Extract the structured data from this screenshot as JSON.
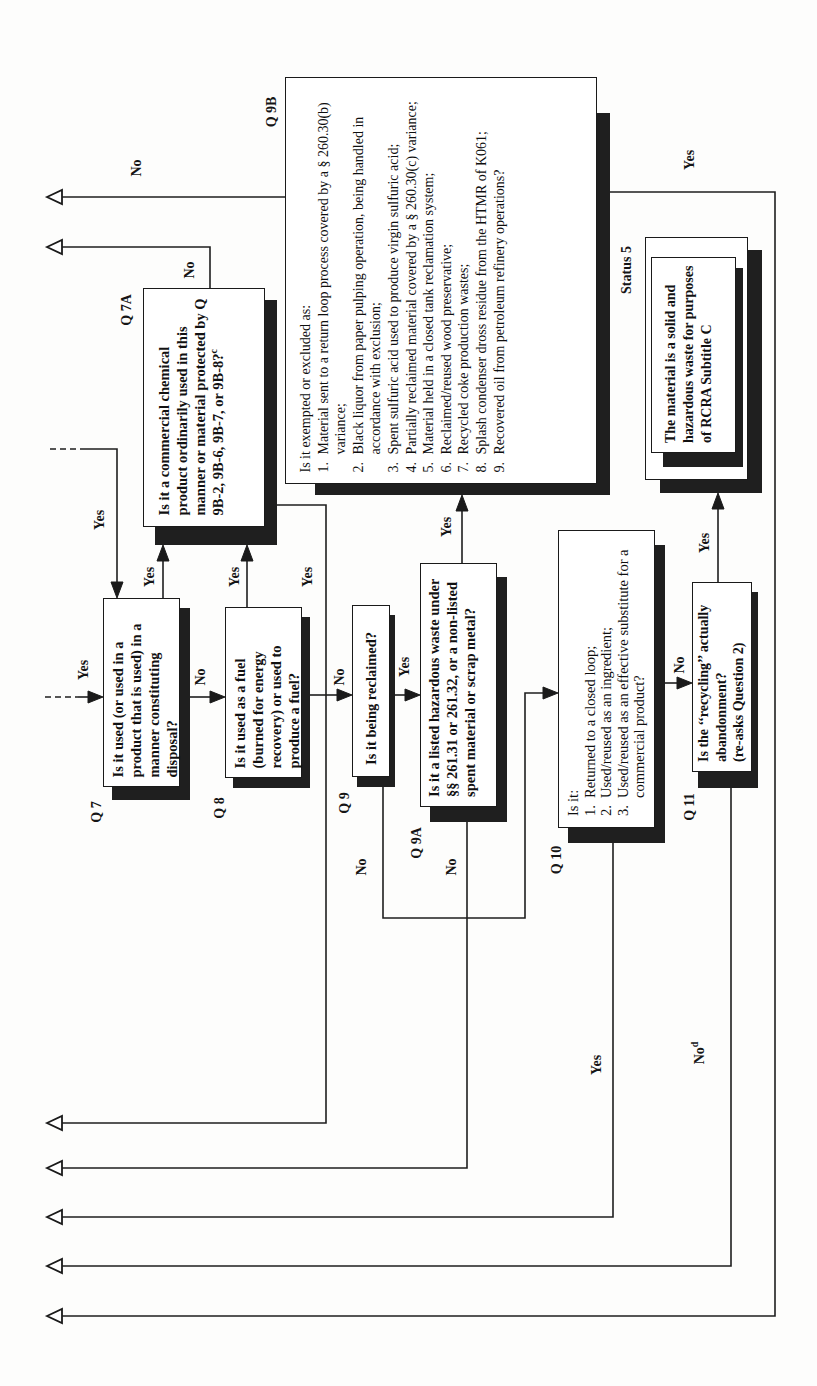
{
  "diagram": {
    "nodes": {
      "q7": {
        "id": "Q 7",
        "text": "Is it used (or used in a product that is used) in a manner constituting disposal?"
      },
      "q7a": {
        "id": "Q 7A",
        "text": "Is it a commercial chemical product ordinarily used in this manner or material protected by Q 9B-2, 9B-6, 9B-7, or 9B-8?",
        "footnote": "c"
      },
      "q8": {
        "id": "Q 8",
        "text": "Is it used as a fuel (burned for energy recovery) or used to produce a fuel?"
      },
      "q9": {
        "id": "Q 9",
        "text": "Is it being reclaimed?"
      },
      "q9a": {
        "id": "Q 9A",
        "text": "Is it a listed hazardous waste under §§ 261.31 or 261.32, or a non-listed spent material or scrap metal?"
      },
      "q9b": {
        "id": "Q 9B",
        "intro": "Is it exempted or excluded as:",
        "items": [
          {
            "num": "1.",
            "text": "Material sent to a return loop process covered by a § 260.30(b) variance;"
          },
          {
            "num": "2.",
            "text": "Black liquor from paper pulping operation, being handled in accordance with exclusion;"
          },
          {
            "num": "3.",
            "text": "Spent sulfuric acid used to produce virgin sulfuric acid;"
          },
          {
            "num": "4.",
            "text": "Partially reclaimed material covered by a § 260.30(c) variance;"
          },
          {
            "num": "5.",
            "text": "Material held in a closed tank reclamation system;"
          },
          {
            "num": "6.",
            "text": "Reclaimed/reused wood preservative;"
          },
          {
            "num": "7.",
            "text": "Recycled coke production wastes;"
          },
          {
            "num": "8.",
            "text": "Splash condenser dross residue from the HTMR of K061;"
          },
          {
            "num": "9.",
            "text": "Recovered oil from petroleum refinery operations?"
          }
        ]
      },
      "q10": {
        "id": "Q 10",
        "intro": "Is it:",
        "items": [
          {
            "num": "1.",
            "text": "Returned to a closed loop;"
          },
          {
            "num": "2.",
            "text": "Used/reused as an ingredient;"
          },
          {
            "num": "3.",
            "text": "Used/reused as an effective substitute for a commercial product?"
          }
        ]
      },
      "q11": {
        "id": "Q 11",
        "text": "Is the ‘‘recycling’’ actually abandonment?",
        "note": "(re-asks Question 2)"
      },
      "status5": {
        "label": "Status 5",
        "text": "The material is a solid and hazardous waste for purposes of RCRA Subtitle C"
      }
    },
    "edge_labels": {
      "q9b_no": "No",
      "q7a_no": "No",
      "entry_top_yes": "Yes",
      "entry_left_yes": "Yes",
      "q7_yes": "Yes",
      "q7_no": "No",
      "q8_yes": "Yes",
      "q7a_yes": "Yes",
      "q8_no": "No",
      "q9_yes": "Yes",
      "q9_no": "No",
      "q9a_yes": "Yes",
      "q9a_no": "No",
      "q10_no": "No",
      "q10_yes": "Yes",
      "q11_yes": "Yes",
      "q11_no": "No",
      "q11_no_footnote": "d",
      "q9b_yes": "Yes"
    }
  }
}
